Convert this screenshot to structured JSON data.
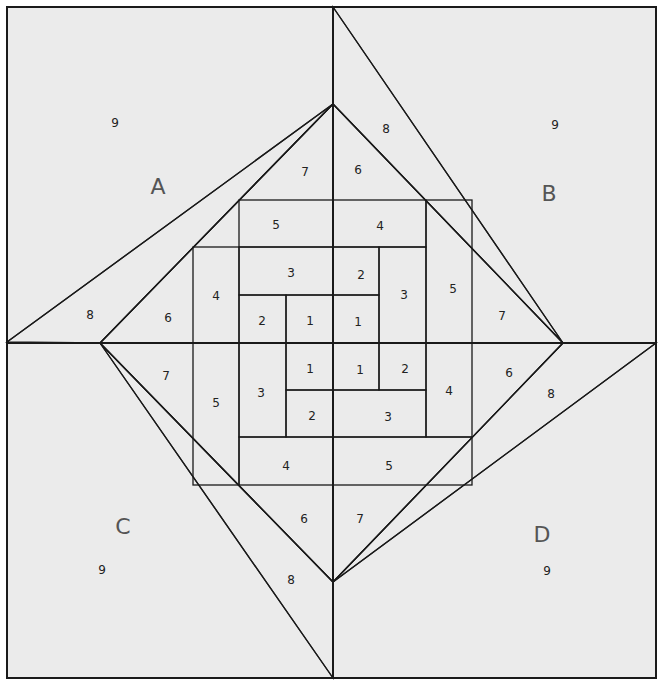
{
  "diagram": {
    "colors": {
      "background_9": "#ebebeb",
      "wedge_8": "#dcdcdc",
      "white": "#ffffff",
      "very_light": "#f7f7f7",
      "light": "#eeeeee",
      "medium": "#e6e6e6",
      "center_1": "#a8a8a8",
      "line": "#1a1a1a"
    },
    "quadrants": {
      "A": {
        "letter": "A",
        "p9": "9",
        "p8": "8",
        "p7": "7",
        "p6": "6",
        "p5": "5",
        "p4": "4",
        "p3": "3",
        "p2": "2",
        "p1": "1"
      },
      "B": {
        "letter": "B",
        "p9": "9",
        "p8": "8",
        "p7": "7",
        "p6": "6",
        "p5": "5",
        "p4": "4",
        "p3": "3",
        "p2": "2",
        "p1": "1"
      },
      "C": {
        "letter": "C",
        "p9": "9",
        "p8": "8",
        "p7": "7",
        "p6": "6",
        "p5": "5",
        "p4": "4",
        "p3": "3",
        "p2": "2",
        "p1": "1"
      },
      "D": {
        "letter": "D",
        "p9": "9",
        "p8": "8",
        "p7": "7",
        "p6": "6",
        "p5": "5",
        "p4": "4",
        "p3": "3",
        "p2": "2",
        "p1": "1"
      }
    }
  }
}
